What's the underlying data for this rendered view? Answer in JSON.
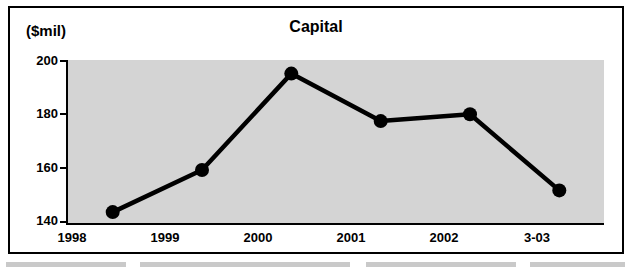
{
  "chart_data": {
    "type": "line",
    "title": "Capital",
    "units_label": "($mil)",
    "xlabel": "",
    "ylabel": "",
    "categories": [
      "1998",
      "1999",
      "2000",
      "2001",
      "2002",
      "3-03"
    ],
    "values": [
      144,
      159.5,
      195,
      177.5,
      180,
      152
    ],
    "ylim": [
      140,
      200
    ],
    "yticks": [
      140,
      160,
      180,
      200
    ],
    "ytick_labels": [
      "140",
      "160",
      "180",
      "200"
    ],
    "grid": false,
    "legend": false,
    "series_color": "#000000",
    "plot_background": "#d4d4d4",
    "marker": "filled-circle"
  }
}
